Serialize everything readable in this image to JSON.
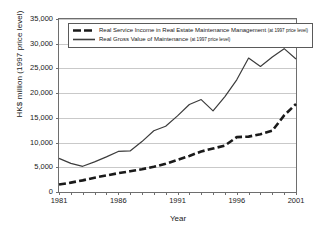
{
  "chart_data": {
    "type": "line",
    "title": "",
    "xlabel": "Year",
    "ylabel": "HK$ million (1997 price level)",
    "xlim": [
      1981,
      2001
    ],
    "ylim": [
      0,
      35000
    ],
    "grid": "horizontal",
    "legend_position": "top-left-inside",
    "x": [
      1981,
      1982,
      1983,
      1984,
      1985,
      1986,
      1987,
      1988,
      1989,
      1990,
      1991,
      1992,
      1993,
      1994,
      1995,
      1996,
      1997,
      1998,
      1999,
      2000,
      2001
    ],
    "xtick_labels": [
      "1981",
      "1986",
      "1991",
      "1996",
      "2001"
    ],
    "xtick_values": [
      1981,
      1986,
      1991,
      1996,
      2001
    ],
    "ytick_labels": [
      "0",
      "5,000",
      "10,000",
      "15,000",
      "20,000",
      "25,000",
      "30,000",
      "35,000"
    ],
    "ytick_values": [
      0,
      5000,
      10000,
      15000,
      20000,
      25000,
      30000,
      35000
    ],
    "series": [
      {
        "name": "Real Service Income in Real Estate Maintenance Management",
        "note": "(at 1997 price level)",
        "style": "dashed",
        "color": "#1a1a1a",
        "width": 2.6,
        "values": [
          1500,
          1900,
          2350,
          2900,
          3350,
          3800,
          4200,
          4600,
          5100,
          5700,
          6500,
          7300,
          8200,
          8800,
          9400,
          11100,
          11200,
          11700,
          12400,
          15500,
          17800
        ]
      },
      {
        "name": "Real Gross Value of Maintenance",
        "note": "(at 1997 price level)",
        "style": "solid",
        "color": "#3c3c3c",
        "width": 1.2,
        "values": [
          6800,
          5800,
          5200,
          6100,
          7100,
          8200,
          8300,
          10200,
          12400,
          13300,
          15400,
          17700,
          18700,
          16400,
          19300,
          22700,
          27100,
          25400,
          27300,
          29000,
          26900
        ]
      }
    ],
    "series_extra_points": {
      "note": "series values continue to 2001 with final segment",
      "series1_tail": [
        19300,
        20300
      ],
      "series2_tail": [
        26800,
        24900,
        23000
      ]
    }
  }
}
